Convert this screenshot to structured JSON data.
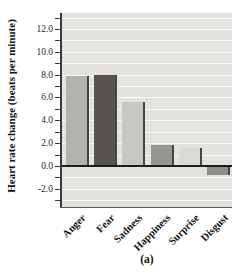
{
  "figure": {
    "ylabel": "Heart rate change (beats per minute)",
    "caption": "(a)"
  },
  "chart_data": {
    "type": "bar",
    "title": "",
    "xlabel": "",
    "ylabel": "Heart rate change (beats per minute)",
    "caption": "(a)",
    "categories": [
      "Anger",
      "Fear",
      "Sadness",
      "Happiness",
      "Surprise",
      "Disgust"
    ],
    "values": [
      7.9,
      8.0,
      5.6,
      1.8,
      1.6,
      -0.8
    ],
    "bar_colors": [
      "#b2b3ad",
      "#57544f",
      "#c7c8c2",
      "#96968f",
      "#dad9d4",
      "#8e8e87"
    ],
    "bar_edge_color": "#45443f",
    "ylim": [
      -3.6,
      13.4
    ],
    "ytick_values": [
      -2,
      0,
      2,
      4,
      6,
      8,
      10,
      12
    ],
    "ytick_labels": [
      "-2.0",
      "0.0",
      "2.0",
      "4.0",
      "6.0",
      "8.0",
      "10.0",
      "12.0"
    ],
    "minor_tick_step": 1,
    "grid": "horizontal",
    "grid_color": "#f8f8f6",
    "plot_bg": "#e3e2df",
    "zero_line_color": "#1c1c1c",
    "legend": "none"
  }
}
